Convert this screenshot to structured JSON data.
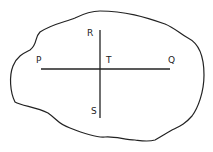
{
  "diagram": {
    "labels": {
      "P": "P",
      "Q": "Q",
      "R": "R",
      "S": "S",
      "T": "T"
    },
    "lines": [
      {
        "name": "PQ",
        "from": "P",
        "to": "Q",
        "orientation": "horizontal"
      },
      {
        "name": "RS",
        "from": "R",
        "to": "S",
        "orientation": "vertical"
      }
    ],
    "intersection": "T",
    "stroke_color": "#222222",
    "background_color": "#ffffff"
  }
}
